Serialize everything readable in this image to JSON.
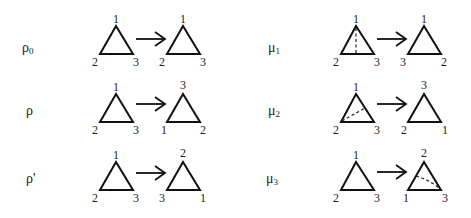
{
  "diagram": {
    "rows": [
      {
        "left": {
          "name": "rho0",
          "symbol": "ρ",
          "subscript": "0",
          "before": {
            "top": "1",
            "bottom_left": "2",
            "bottom_right": "3"
          },
          "after": {
            "top": "1",
            "bottom_left": "2",
            "bottom_right": "3"
          },
          "axis": null
        },
        "right": {
          "name": "mu1",
          "symbol": "μ",
          "subscript": "1",
          "before": {
            "top": "1",
            "bottom_left": "2",
            "bottom_right": "3"
          },
          "after": {
            "top": "1",
            "bottom_left": "3",
            "bottom_right": "2"
          },
          "axis": "before-vertical-from-top"
        }
      },
      {
        "left": {
          "name": "rho",
          "symbol": "ρ",
          "subscript": "",
          "before": {
            "top": "1",
            "bottom_left": "2",
            "bottom_right": "3"
          },
          "after": {
            "top": "3",
            "bottom_left": "1",
            "bottom_right": "2"
          },
          "axis": null
        },
        "right": {
          "name": "mu2",
          "symbol": "μ",
          "subscript": "2",
          "before": {
            "top": "1",
            "bottom_left": "2",
            "bottom_right": "3"
          },
          "after": {
            "top": "3",
            "bottom_left": "2",
            "bottom_right": "1"
          },
          "axis": "before-from-bottom-left"
        }
      },
      {
        "left": {
          "name": "rho-prime",
          "symbol": "ρ'",
          "subscript": "",
          "before": {
            "top": "1",
            "bottom_left": "2",
            "bottom_right": "3"
          },
          "after": {
            "top": "2",
            "bottom_left": "3",
            "bottom_right": "1"
          },
          "axis": null
        },
        "right": {
          "name": "mu3",
          "symbol": "μ",
          "subscript": "3",
          "before": {
            "top": "1",
            "bottom_left": "2",
            "bottom_right": "3"
          },
          "after": {
            "top": "2",
            "bottom_left": "1",
            "bottom_right": "3"
          },
          "axis": "after-from-bottom-right"
        }
      }
    ],
    "colors": {
      "stroke": "#111111",
      "background": "#ffffff"
    }
  }
}
